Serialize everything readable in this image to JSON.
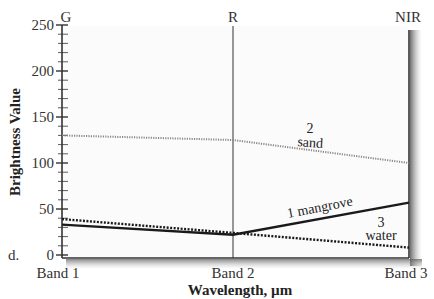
{
  "chart_data": {
    "type": "line",
    "title": "",
    "panel_letter": "d.",
    "xlabel": "Wavelength, µm",
    "ylabel": "Brightness Value",
    "ylim": [
      0,
      250
    ],
    "yticks": [
      0,
      50,
      100,
      150,
      200,
      250
    ],
    "ytick_labels": [
      "0",
      "50",
      "100",
      "150",
      "200",
      "250"
    ],
    "categories": [
      "Band 1",
      "Band 2",
      "Band 3"
    ],
    "top_labels": [
      "G",
      "R",
      "NIR"
    ],
    "grid": false,
    "series": [
      {
        "name": "1 mangrove",
        "number": "1",
        "label": "mangrove",
        "values": [
          33,
          22,
          57
        ],
        "style": "solid",
        "color": "#1a1a1a"
      },
      {
        "name": "2 sand",
        "number": "2",
        "label": "sand",
        "values": [
          130,
          125,
          100
        ],
        "style": "dotted",
        "color": "#8a8a8a"
      },
      {
        "name": "3 water",
        "number": "3",
        "label": "water",
        "values": [
          39,
          24,
          8
        ],
        "style": "dotted",
        "color": "#1a1a1a"
      }
    ],
    "annotations": [
      "2 sand",
      "1 mangrove",
      "3 water"
    ]
  },
  "labels": {
    "y_axis_title": "Brightness Value",
    "x_axis_title": "Wavelength, µm",
    "panel": "d.",
    "band1": "Band 1",
    "band2": "Band 2",
    "band3": "Band 3",
    "top_g": "G",
    "top_r": "R",
    "top_nir": "NIR",
    "sand_num": "2",
    "sand_text": "sand",
    "mangrove_text": "1 mangrove",
    "water_num": "3",
    "water_text": "water",
    "y0": "0",
    "y50": "50",
    "y100": "100",
    "y150": "150",
    "y200": "200",
    "y250": "250"
  }
}
